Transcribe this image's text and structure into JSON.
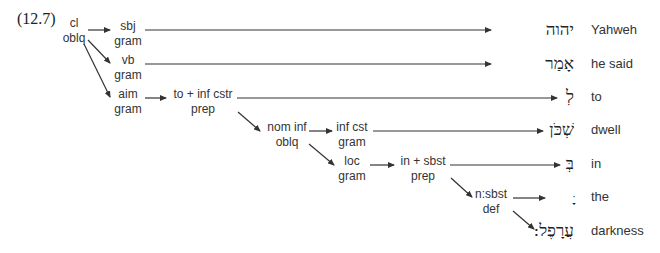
{
  "example_label": "(12.7)",
  "nodes": {
    "root": {
      "top": "cl",
      "bottom": "oblq"
    },
    "sbj": {
      "top": "sbj",
      "bottom": "gram"
    },
    "vb": {
      "top": "vb",
      "bottom": "gram"
    },
    "aim": {
      "top": "aim",
      "bottom": "gram"
    },
    "to_inf": {
      "top": "to + inf cstr",
      "bottom": "prep"
    },
    "nom_inf": {
      "top": "nom inf",
      "bottom": "oblq"
    },
    "inf_cst": {
      "top": "inf cst",
      "bottom": "gram"
    },
    "loc": {
      "top": "loc",
      "bottom": "gram"
    },
    "in_sbst": {
      "top": "in + sbst",
      "bottom": "prep"
    },
    "n_sbst": {
      "top": "n:sbst",
      "bottom": "def"
    }
  },
  "words": [
    {
      "hebrew": "יהוה",
      "gloss": "Yahweh"
    },
    {
      "hebrew": "אָמַר",
      "gloss": "he said"
    },
    {
      "hebrew": "לְ",
      "gloss": "to"
    },
    {
      "hebrew": "שְׁכֹּן",
      "gloss": "dwell"
    },
    {
      "hebrew": "בְּ",
      "gloss": "in"
    },
    {
      "hebrew": "ָּ",
      "gloss": "the"
    },
    {
      "hebrew": "עֲרָפֶל:",
      "gloss": "darkness"
    }
  ],
  "colors": {
    "line": "#333333",
    "text": "#333333"
  }
}
